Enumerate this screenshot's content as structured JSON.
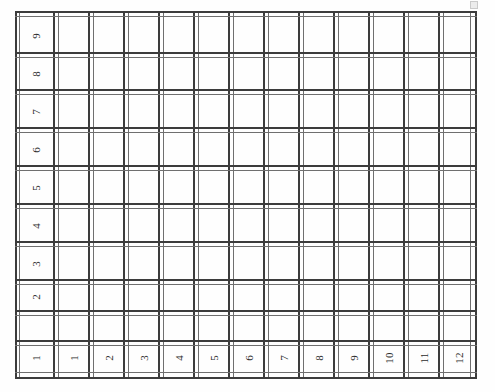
{
  "page": {
    "kind": "scanned-grid-form",
    "background_color": "#fefefe",
    "line_color": "#3c3c3c",
    "thin_line_color": "#6f6f6f",
    "text_color": "#2b2b2b"
  },
  "grid": {
    "columns_total": 13,
    "rows_total": 10,
    "header_column_label": "",
    "header_row_label": "",
    "text_orientation": "rotated-90-ccw",
    "row_labels": [
      "9",
      "8",
      "7",
      "6",
      "5",
      "4",
      "3",
      "2",
      "1"
    ],
    "column_labels": [
      "1",
      "2",
      "3",
      "4",
      "5",
      "6",
      "7",
      "8",
      "9",
      "10",
      "11",
      "12"
    ],
    "body_cells": [
      [
        "",
        "",
        "",
        "",
        "",
        "",
        "",
        "",
        "",
        "",
        "",
        ""
      ],
      [
        "",
        "",
        "",
        "",
        "",
        "",
        "",
        "",
        "",
        "",
        "",
        ""
      ],
      [
        "",
        "",
        "",
        "",
        "",
        "",
        "",
        "",
        "",
        "",
        "",
        ""
      ],
      [
        "",
        "",
        "",
        "",
        "",
        "",
        "",
        "",
        "",
        "",
        "",
        ""
      ],
      [
        "",
        "",
        "",
        "",
        "",
        "",
        "",
        "",
        "",
        "",
        "",
        ""
      ],
      [
        "",
        "",
        "",
        "",
        "",
        "",
        "",
        "",
        "",
        "",
        "",
        ""
      ],
      [
        "",
        "",
        "",
        "",
        "",
        "",
        "",
        "",
        "",
        "",
        "",
        ""
      ],
      [
        "",
        "",
        "",
        "",
        "",
        "",
        "",
        "",
        "",
        "",
        "",
        ""
      ],
      [
        "",
        "",
        "",
        "",
        "",
        "",
        "",
        "",
        "",
        "",
        "",
        ""
      ]
    ]
  },
  "artifact": {
    "name": "scan-speck",
    "label": ""
  }
}
